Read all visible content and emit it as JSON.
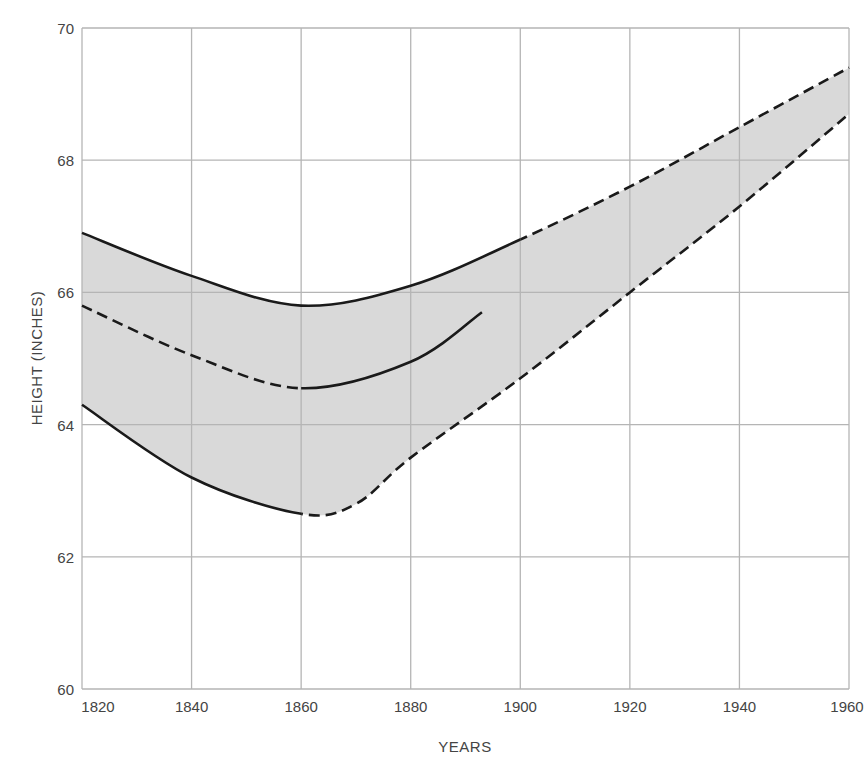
{
  "chart_data": {
    "type": "line",
    "title": "",
    "xlabel": "YEARS",
    "ylabel": "HEIGHT (INCHES)",
    "xlim": [
      1820,
      1960
    ],
    "ylim": [
      60,
      70
    ],
    "grid": true,
    "legend": null,
    "x_ticks": [
      "1820",
      "1840",
      "1860",
      "1880",
      "1900",
      "1920",
      "1940",
      "1960"
    ],
    "y_ticks": [
      "60",
      "62",
      "64",
      "66",
      "68",
      "70"
    ],
    "shaded_band": {
      "between": [
        "upper",
        "lower"
      ],
      "color": "#d9d9d9"
    },
    "series": [
      {
        "name": "upper",
        "style": "solid to 1900, dashed after",
        "x": [
          1820,
          1840,
          1860,
          1880,
          1900,
          1920,
          1940,
          1960
        ],
        "values": [
          66.9,
          66.25,
          65.8,
          66.1,
          66.8,
          67.6,
          68.5,
          69.4
        ]
      },
      {
        "name": "middle",
        "style": "dashed to 1860, solid after",
        "x": [
          1820,
          1840,
          1860,
          1880,
          1893
        ],
        "values": [
          65.8,
          65.05,
          64.55,
          64.95,
          65.7
        ]
      },
      {
        "name": "lower",
        "style": "solid to 1860, dashed after",
        "x": [
          1820,
          1840,
          1860,
          1870,
          1880,
          1900,
          1920,
          1940,
          1960
        ],
        "values": [
          64.3,
          63.2,
          62.65,
          62.8,
          63.5,
          64.7,
          66.0,
          67.3,
          68.7
        ]
      }
    ]
  },
  "colors": {
    "grid": "#b5b5b5",
    "line": "#1a1a1a",
    "band": "#d9d9d9",
    "text": "#444444"
  }
}
